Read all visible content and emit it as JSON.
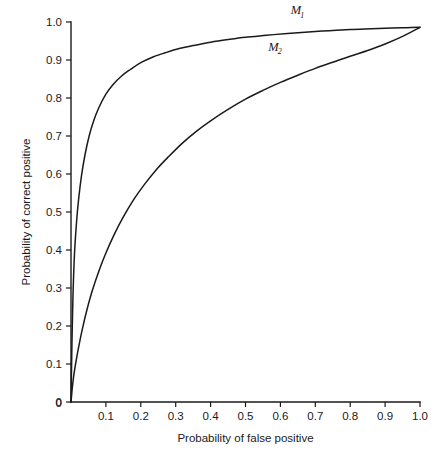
{
  "chart_data": {
    "type": "line",
    "title": "",
    "xlabel": "Probability of false positive",
    "ylabel": "Probability of correct positive",
    "xlim": [
      0,
      1
    ],
    "ylim": [
      0,
      1
    ],
    "grid": false,
    "legend_position": "inline-curve-labels",
    "xticks": [
      "0",
      "0.1",
      "0.2",
      "0.3",
      "0.4",
      "0.5",
      "0.6",
      "0.7",
      "0.8",
      "0.9",
      "1.0"
    ],
    "yticks": [
      "0",
      "0.1",
      "0.2",
      "0.3",
      "0.4",
      "0.5",
      "0.6",
      "0.7",
      "0.8",
      "0.9",
      "1.0"
    ],
    "xtick_values": [
      0,
      0.1,
      0.2,
      0.3,
      0.4,
      0.5,
      0.6,
      0.7,
      0.8,
      0.9,
      1.0
    ],
    "ytick_values": [
      0,
      0.1,
      0.2,
      0.3,
      0.4,
      0.5,
      0.6,
      0.7,
      0.8,
      0.9,
      1.0
    ],
    "series": [
      {
        "name": "M1",
        "label_base": "M",
        "label_sub": "1",
        "label_x": 0.63,
        "label_y": 1.02,
        "x": [
          0.0,
          0.003,
          0.006,
          0.01,
          0.016,
          0.022,
          0.03,
          0.04,
          0.052,
          0.065,
          0.08,
          0.1,
          0.12,
          0.145,
          0.17,
          0.2,
          0.235,
          0.27,
          0.31,
          0.35,
          0.4,
          0.45,
          0.5,
          0.56,
          0.62,
          0.68,
          0.74,
          0.8,
          0.86,
          0.92,
          0.96,
          1.0
        ],
        "y": [
          0.0,
          0.17,
          0.29,
          0.39,
          0.475,
          0.535,
          0.595,
          0.65,
          0.7,
          0.74,
          0.775,
          0.81,
          0.835,
          0.858,
          0.875,
          0.893,
          0.908,
          0.919,
          0.93,
          0.938,
          0.947,
          0.954,
          0.96,
          0.965,
          0.97,
          0.974,
          0.977,
          0.98,
          0.982,
          0.984,
          0.985,
          0.986
        ]
      },
      {
        "name": "M2",
        "label_base": "M",
        "label_sub": "2",
        "label_x": 0.565,
        "label_y": 0.925,
        "x": [
          0.0,
          0.004,
          0.008,
          0.014,
          0.022,
          0.032,
          0.045,
          0.06,
          0.08,
          0.1,
          0.125,
          0.15,
          0.18,
          0.21,
          0.245,
          0.28,
          0.32,
          0.36,
          0.4,
          0.45,
          0.5,
          0.55,
          0.6,
          0.65,
          0.7,
          0.75,
          0.8,
          0.85,
          0.9,
          0.95,
          1.0
        ],
        "y": [
          0.0,
          0.04,
          0.07,
          0.105,
          0.145,
          0.19,
          0.24,
          0.29,
          0.345,
          0.392,
          0.443,
          0.487,
          0.533,
          0.572,
          0.612,
          0.646,
          0.682,
          0.713,
          0.74,
          0.77,
          0.797,
          0.82,
          0.841,
          0.86,
          0.878,
          0.894,
          0.91,
          0.925,
          0.942,
          0.962,
          0.986
        ]
      }
    ]
  },
  "axes": {
    "x_title": "Probability of false positive",
    "y_title": "Probability of correct positive"
  }
}
